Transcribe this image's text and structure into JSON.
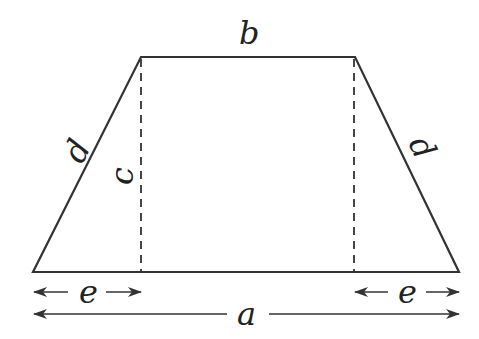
{
  "figure": {
    "shape": "isosceles-trapezoid",
    "stroke_color": "#333333",
    "background": "#ffffff",
    "vertices": {
      "top_left": [
        141,
        57
      ],
      "top_right": [
        355,
        57
      ],
      "bottom_right": [
        459,
        272
      ],
      "bottom_left": [
        33,
        272
      ]
    },
    "labels": {
      "top_base": "b",
      "bottom_base": "a",
      "left_leg": "d",
      "right_leg": "d",
      "height": "c",
      "left_offset": "e",
      "right_offset": "e"
    }
  }
}
